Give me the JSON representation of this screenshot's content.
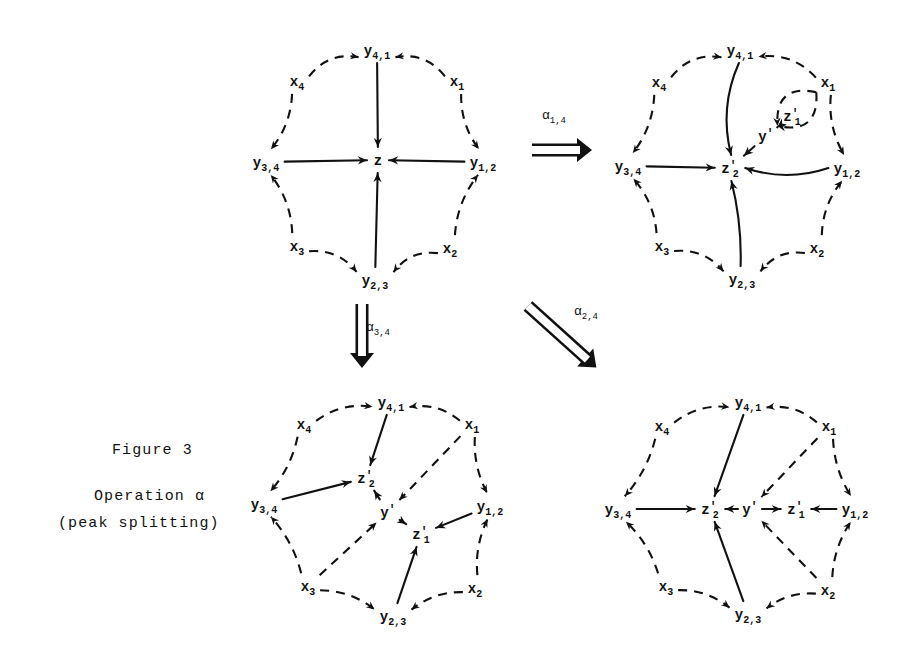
{
  "figure": {
    "caption_line_1": "Figure 3",
    "caption_line_2": "Operation α",
    "caption_line_3": "(peak splitting)"
  },
  "colors": {
    "ink": "#111111",
    "background": "#ffffff"
  },
  "operations": [
    {
      "name": "alpha-1-4",
      "symbol": "α",
      "subscript": "1,4",
      "direction": "right",
      "from_panel": "top-left",
      "to_panel": "top-right"
    },
    {
      "name": "alpha-3-4",
      "symbol": "α",
      "subscript": "3,4",
      "direction": "down",
      "from_panel": "top-left",
      "to_panel": "bottom-left"
    },
    {
      "name": "alpha-2-4",
      "symbol": "α",
      "subscript": "2,4",
      "direction": "diagonal",
      "from_panel": "top-left",
      "to_panel": "bottom-right"
    }
  ],
  "panels": [
    {
      "id": "top-left",
      "name": "octagon-before",
      "origin": [
        252,
        34
      ],
      "size": [
        250,
        262
      ],
      "nodes": [
        {
          "id": "y41",
          "label": "y",
          "sub": "4,1",
          "prime": false,
          "x": 125,
          "y": 16
        },
        {
          "id": "x1",
          "label": "x",
          "sub": "1",
          "prime": false,
          "x": 205,
          "y": 47
        },
        {
          "id": "y12",
          "label": "y",
          "sub": "1,2",
          "prime": false,
          "x": 231,
          "y": 128
        },
        {
          "id": "x2",
          "label": "x",
          "sub": "2",
          "prime": false,
          "x": 198,
          "y": 214
        },
        {
          "id": "y23",
          "label": "y",
          "sub": "2,3",
          "prime": false,
          "x": 123,
          "y": 246
        },
        {
          "id": "x3",
          "label": "x",
          "sub": "3",
          "prime": false,
          "x": 45,
          "y": 212
        },
        {
          "id": "y34",
          "label": "y",
          "sub": "3,4",
          "prime": false,
          "x": 14,
          "y": 128
        },
        {
          "id": "x4",
          "label": "x",
          "sub": "4",
          "prime": false,
          "x": 45,
          "y": 47
        },
        {
          "id": "z",
          "label": "z",
          "sub": "",
          "prime": false,
          "x": 126,
          "y": 126
        }
      ],
      "edges": [
        {
          "from": "x4",
          "to": "y41",
          "style": "dashed",
          "curve": -16
        },
        {
          "from": "x1",
          "to": "y41",
          "style": "dashed",
          "curve": 16
        },
        {
          "from": "x1",
          "to": "y12",
          "style": "dashed",
          "curve": 10
        },
        {
          "from": "x2",
          "to": "y12",
          "style": "dashed",
          "curve": -10
        },
        {
          "from": "x2",
          "to": "y23",
          "style": "dashed",
          "curve": 14
        },
        {
          "from": "x3",
          "to": "y23",
          "style": "dashed",
          "curve": -14
        },
        {
          "from": "x3",
          "to": "y34",
          "style": "dashed",
          "curve": 10
        },
        {
          "from": "x4",
          "to": "y34",
          "style": "dashed",
          "curve": -10
        },
        {
          "from": "y41",
          "to": "z",
          "style": "solid",
          "curve": 0
        },
        {
          "from": "y23",
          "to": "z",
          "style": "solid",
          "curve": 0
        },
        {
          "from": "y34",
          "to": "z",
          "style": "solid",
          "curve": 0
        },
        {
          "from": "y12",
          "to": "z",
          "style": "solid",
          "curve": 0
        }
      ]
    },
    {
      "id": "top-right",
      "name": "octagon-after-alpha-1-4",
      "origin": [
        614,
        34
      ],
      "size": [
        252,
        262
      ],
      "nodes": [
        {
          "id": "y41",
          "label": "y",
          "sub": "4,1",
          "prime": false,
          "x": 126,
          "y": 16
        },
        {
          "id": "x1",
          "label": "x",
          "sub": "1",
          "prime": false,
          "x": 214,
          "y": 48
        },
        {
          "id": "y12",
          "label": "y",
          "sub": "1,2",
          "prime": false,
          "x": 233,
          "y": 134
        },
        {
          "id": "x2",
          "label": "x",
          "sub": "2",
          "prime": false,
          "x": 203,
          "y": 214
        },
        {
          "id": "y23",
          "label": "y",
          "sub": "2,3",
          "prime": false,
          "x": 128,
          "y": 245
        },
        {
          "id": "x3",
          "label": "x",
          "sub": "3",
          "prime": false,
          "x": 48,
          "y": 212
        },
        {
          "id": "y34",
          "label": "y",
          "sub": "3,4",
          "prime": false,
          "x": 14,
          "y": 132
        },
        {
          "id": "x4",
          "label": "x",
          "sub": "4",
          "prime": false,
          "x": 45,
          "y": 48
        },
        {
          "id": "z2",
          "label": "z",
          "sub": "2",
          "prime": true,
          "x": 116,
          "y": 134
        },
        {
          "id": "y1p",
          "label": "y",
          "sub": "",
          "prime": true,
          "x": 152,
          "y": 102
        },
        {
          "id": "z1",
          "label": "z",
          "sub": "1",
          "prime": true,
          "x": 178,
          "y": 82
        }
      ],
      "edges": [
        {
          "from": "x4",
          "to": "y41",
          "style": "dashed",
          "curve": -16
        },
        {
          "from": "x1",
          "to": "y41",
          "style": "dashed",
          "curve": 16
        },
        {
          "from": "x1",
          "to": "y12",
          "style": "dashed",
          "curve": 10
        },
        {
          "from": "x2",
          "to": "y12",
          "style": "dashed",
          "curve": -10
        },
        {
          "from": "x2",
          "to": "y23",
          "style": "dashed",
          "curve": 14
        },
        {
          "from": "x3",
          "to": "y23",
          "style": "dashed",
          "curve": -14
        },
        {
          "from": "x3",
          "to": "y34",
          "style": "dashed",
          "curve": 10
        },
        {
          "from": "x4",
          "to": "y34",
          "style": "dashed",
          "curve": -10
        },
        {
          "from": "y41",
          "to": "z2",
          "style": "solid",
          "curve": 16
        },
        {
          "from": "y23",
          "to": "z2",
          "style": "solid",
          "curve": 6
        },
        {
          "from": "y34",
          "to": "z2",
          "style": "solid",
          "curve": 0
        },
        {
          "from": "y12",
          "to": "z2",
          "style": "solid",
          "curve": -14
        },
        {
          "from": "y1p",
          "to": "z2",
          "style": "solid",
          "curve": 0
        },
        {
          "from": "y1p",
          "to": "z1",
          "style": "solid",
          "curve": 0
        },
        {
          "from": "x1",
          "to": "y1p",
          "style": "dashed",
          "curve": 34
        },
        {
          "from": "x1",
          "to": "y1p",
          "style": "dashed",
          "curve": -34
        }
      ]
    },
    {
      "id": "bottom-left",
      "name": "octagon-after-alpha-3-4",
      "origin": [
        246,
        386
      ],
      "size": [
        256,
        256
      ],
      "nodes": [
        {
          "id": "y41",
          "label": "y",
          "sub": "4,1",
          "prime": false,
          "x": 145,
          "y": 16
        },
        {
          "id": "x1",
          "label": "x",
          "sub": "1",
          "prime": false,
          "x": 226,
          "y": 38
        },
        {
          "id": "y12",
          "label": "y",
          "sub": "1,2",
          "prime": false,
          "x": 244,
          "y": 120
        },
        {
          "id": "x2",
          "label": "x",
          "sub": "2",
          "prime": false,
          "x": 229,
          "y": 202
        },
        {
          "id": "y23",
          "label": "y",
          "sub": "2,3",
          "prime": false,
          "x": 147,
          "y": 230
        },
        {
          "id": "x3",
          "label": "x",
          "sub": "3",
          "prime": false,
          "x": 62,
          "y": 200
        },
        {
          "id": "y34",
          "label": "y",
          "sub": "3,4",
          "prime": false,
          "x": 18,
          "y": 118
        },
        {
          "id": "x4",
          "label": "x",
          "sub": "4",
          "prime": false,
          "x": 58,
          "y": 38
        },
        {
          "id": "z2",
          "label": "z",
          "sub": "2",
          "prime": true,
          "x": 120,
          "y": 92
        },
        {
          "id": "y1p",
          "label": "y",
          "sub": "",
          "prime": true,
          "x": 142,
          "y": 126
        },
        {
          "id": "z1",
          "label": "z",
          "sub": "1",
          "prime": true,
          "x": 175,
          "y": 148
        }
      ],
      "edges": [
        {
          "from": "x4",
          "to": "y41",
          "style": "dashed",
          "curve": -12
        },
        {
          "from": "x1",
          "to": "y41",
          "style": "dashed",
          "curve": 12
        },
        {
          "from": "x1",
          "to": "y12",
          "style": "dashed",
          "curve": 8
        },
        {
          "from": "x2",
          "to": "y12",
          "style": "dashed",
          "curve": -8
        },
        {
          "from": "x2",
          "to": "y23",
          "style": "dashed",
          "curve": 10
        },
        {
          "from": "x3",
          "to": "y23",
          "style": "dashed",
          "curve": -10
        },
        {
          "from": "x3",
          "to": "y34",
          "style": "dashed",
          "curve": 8
        },
        {
          "from": "x4",
          "to": "y34",
          "style": "dashed",
          "curve": -8
        },
        {
          "from": "y41",
          "to": "z2",
          "style": "solid",
          "curve": 0
        },
        {
          "from": "y34",
          "to": "z2",
          "style": "solid",
          "curve": 0
        },
        {
          "from": "y12",
          "to": "z1",
          "style": "solid",
          "curve": 0
        },
        {
          "from": "y23",
          "to": "z1",
          "style": "solid",
          "curve": 0
        },
        {
          "from": "y1p",
          "to": "z2",
          "style": "solid",
          "curve": 0
        },
        {
          "from": "y1p",
          "to": "z1",
          "style": "solid",
          "curve": 0
        },
        {
          "from": "x1",
          "to": "y1p",
          "style": "dashed",
          "curve": 0
        },
        {
          "from": "x3",
          "to": "y1p",
          "style": "dashed",
          "curve": 0
        }
      ]
    },
    {
      "id": "bottom-right",
      "name": "octagon-after-alpha-2-4",
      "origin": [
        600,
        386
      ],
      "size": [
        268,
        256
      ],
      "nodes": [
        {
          "id": "y41",
          "label": "y",
          "sub": "4,1",
          "prime": false,
          "x": 148,
          "y": 16
        },
        {
          "id": "x1",
          "label": "x",
          "sub": "1",
          "prime": false,
          "x": 229,
          "y": 40
        },
        {
          "id": "y12",
          "label": "y",
          "sub": "1,2",
          "prime": false,
          "x": 255,
          "y": 123
        },
        {
          "id": "x2",
          "label": "x",
          "sub": "2",
          "prime": false,
          "x": 228,
          "y": 204
        },
        {
          "id": "y23",
          "label": "y",
          "sub": "2,3",
          "prime": false,
          "x": 148,
          "y": 228
        },
        {
          "id": "x3",
          "label": "x",
          "sub": "3",
          "prime": false,
          "x": 66,
          "y": 200
        },
        {
          "id": "y34",
          "label": "y",
          "sub": "3,4",
          "prime": false,
          "x": 18,
          "y": 123
        },
        {
          "id": "x4",
          "label": "x",
          "sub": "4",
          "prime": false,
          "x": 62,
          "y": 40
        },
        {
          "id": "z2",
          "label": "z",
          "sub": "2",
          "prime": true,
          "x": 110,
          "y": 123
        },
        {
          "id": "y1p",
          "label": "y",
          "sub": "",
          "prime": true,
          "x": 150,
          "y": 123
        },
        {
          "id": "z1",
          "label": "z",
          "sub": "1",
          "prime": true,
          "x": 196,
          "y": 123
        }
      ],
      "edges": [
        {
          "from": "x4",
          "to": "y41",
          "style": "dashed",
          "curve": -12
        },
        {
          "from": "x1",
          "to": "y41",
          "style": "dashed",
          "curve": 12
        },
        {
          "from": "x1",
          "to": "y12",
          "style": "dashed",
          "curve": 8
        },
        {
          "from": "x2",
          "to": "y12",
          "style": "dashed",
          "curve": -8
        },
        {
          "from": "x2",
          "to": "y23",
          "style": "dashed",
          "curve": 10
        },
        {
          "from": "x3",
          "to": "y23",
          "style": "dashed",
          "curve": -10
        },
        {
          "from": "x3",
          "to": "y34",
          "style": "dashed",
          "curve": 8
        },
        {
          "from": "x4",
          "to": "y34",
          "style": "dashed",
          "curve": -8
        },
        {
          "from": "y41",
          "to": "z2",
          "style": "solid",
          "curve": 0
        },
        {
          "from": "y23",
          "to": "z2",
          "style": "solid",
          "curve": 0
        },
        {
          "from": "y34",
          "to": "z2",
          "style": "solid",
          "curve": 0
        },
        {
          "from": "y12",
          "to": "z1",
          "style": "solid",
          "curve": 0
        },
        {
          "from": "y1p",
          "to": "z2",
          "style": "solid",
          "curve": 0
        },
        {
          "from": "y1p",
          "to": "z1",
          "style": "solid",
          "curve": 0
        },
        {
          "from": "x1",
          "to": "y1p",
          "style": "dashed",
          "curve": 0
        },
        {
          "from": "x2",
          "to": "y1p",
          "style": "dashed",
          "curve": 0
        }
      ]
    }
  ]
}
